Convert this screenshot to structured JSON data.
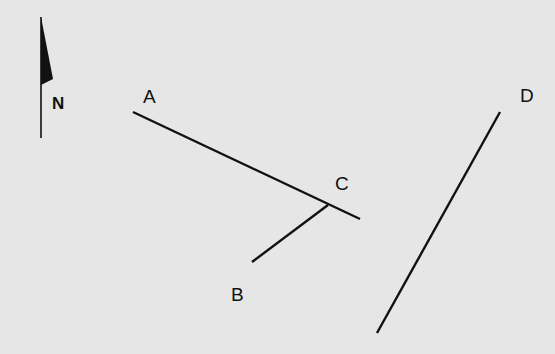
{
  "diagram": {
    "type": "map-sketch",
    "north_arrow": {
      "label": "N"
    },
    "labels": {
      "a": "A",
      "b": "B",
      "c": "C",
      "d": "D"
    },
    "segments": [
      {
        "name": "A-C line",
        "from": [
          133,
          112
        ],
        "to": [
          360,
          219
        ]
      },
      {
        "name": "C-B line",
        "from": [
          328,
          205
        ],
        "to": [
          252,
          262
        ]
      },
      {
        "name": "D line",
        "from": [
          500,
          112
        ],
        "to": [
          377,
          333
        ]
      }
    ],
    "colors": {
      "background": "#e6e6e6",
      "ink": "#111111"
    }
  }
}
